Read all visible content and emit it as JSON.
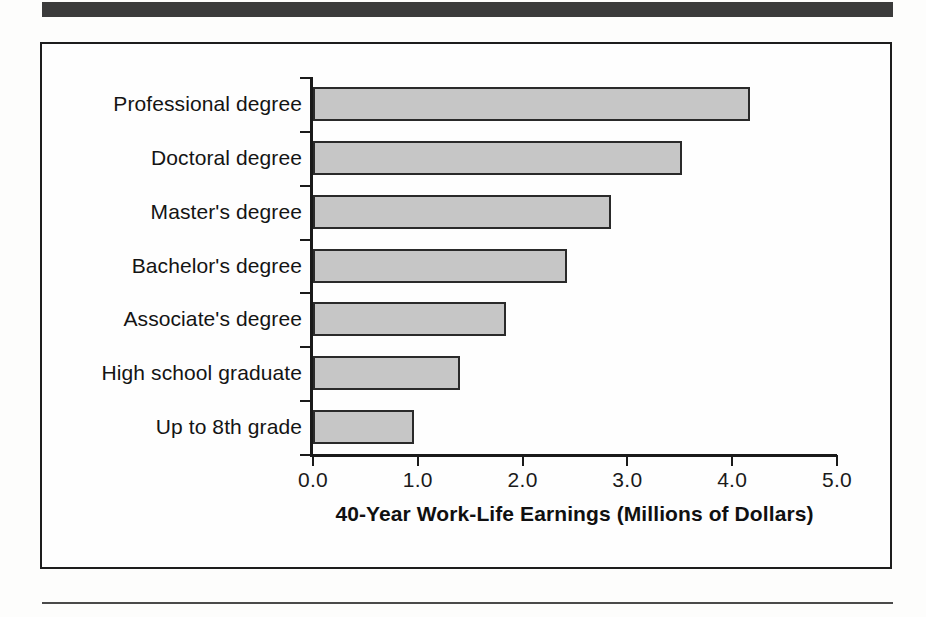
{
  "figure": {
    "top_band": "decorative-dark-rule",
    "bottom_rule": "decorative-thin-rule"
  },
  "chart_data": {
    "type": "bar",
    "orientation": "horizontal",
    "title": "",
    "xlabel": "40-Year Work-Life Earnings (Millions of Dollars)",
    "ylabel": "",
    "xlim": [
      0.0,
      5.0
    ],
    "xticks": [
      "0.0",
      "1.0",
      "2.0",
      "3.0",
      "4.0",
      "5.0"
    ],
    "xtick_values": [
      0.0,
      1.0,
      2.0,
      3.0,
      4.0,
      5.0
    ],
    "grid": false,
    "legend": null,
    "bar_fill_color": "#c6c6c6",
    "bar_edge_color": "#2a2a2a",
    "categories": [
      "Professional degree",
      "Doctoral degree",
      "Master's degree",
      "Bachelor's degree",
      "Associate's degree",
      "High school graduate",
      "Up to 8th grade"
    ],
    "values": [
      4.17,
      3.52,
      2.84,
      2.42,
      1.84,
      1.4,
      0.96
    ]
  }
}
